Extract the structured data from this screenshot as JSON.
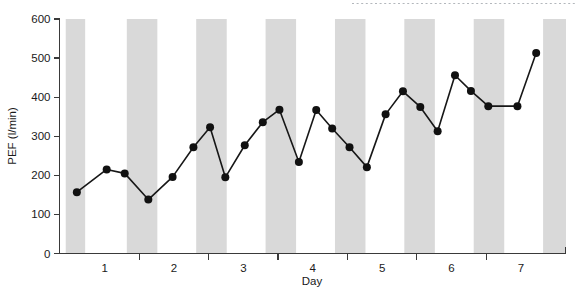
{
  "chart_data": {
    "type": "line",
    "title": "",
    "xlabel": "Day",
    "ylabel": "PEF (l/min)",
    "xlim": [
      0.35,
      7.65
    ],
    "ylim": [
      0,
      600
    ],
    "grid": false,
    "legend": "none",
    "y_ticks": [
      0,
      100,
      200,
      300,
      400,
      500,
      600
    ],
    "y_tick_labels": [
      "0",
      "100",
      "200",
      "300",
      "400",
      "500",
      "600"
    ],
    "x_ticks": [
      1.5,
      2.5,
      3.5,
      4.5,
      5.5,
      6.5
    ],
    "x_tick_labels": [
      "1",
      "2",
      "3",
      "4",
      "5",
      "6",
      "7"
    ],
    "x_label_positions": [
      1,
      2,
      3,
      4,
      5,
      6,
      7
    ],
    "marker": "filled-circle",
    "marker_size": 4,
    "line_color": "#171717",
    "marker_color": "#111111",
    "band_color": "#d9d9d9",
    "background_color": "#ffffff",
    "axis_color": "#3a3a3a",
    "night_bands_label": "night (shaded)",
    "night_bands": [
      {
        "start": 0.44,
        "end": 0.72
      },
      {
        "start": 1.32,
        "end": 1.76
      },
      {
        "start": 2.32,
        "end": 2.76
      },
      {
        "start": 3.32,
        "end": 3.76
      },
      {
        "start": 4.32,
        "end": 4.76
      },
      {
        "start": 5.32,
        "end": 5.76
      },
      {
        "start": 6.32,
        "end": 6.76
      },
      {
        "start": 7.32,
        "end": 7.65
      }
    ],
    "x": [
      0.6,
      1.03,
      1.29,
      1.63,
      1.98,
      2.28,
      2.52,
      2.74,
      3.02,
      3.28,
      3.52,
      3.78,
      4.03,
      4.26,
      4.51,
      4.76,
      5.03,
      5.28,
      5.53,
      5.78,
      6.02,
      6.52,
      6.78,
      7.28
    ],
    "values": [
      157,
      215,
      205,
      138,
      196,
      272,
      323,
      195,
      277,
      336,
      368,
      234,
      367,
      320,
      272,
      221,
      356,
      415,
      375,
      313,
      456,
      416,
      377,
      377
    ],
    "points": [
      {
        "day": 0.6,
        "pef": 157
      },
      {
        "day": 1.03,
        "pef": 215
      },
      {
        "day": 1.29,
        "pef": 205
      },
      {
        "day": 1.63,
        "pef": 138
      },
      {
        "day": 1.98,
        "pef": 196
      },
      {
        "day": 2.28,
        "pef": 272
      },
      {
        "day": 2.52,
        "pef": 323
      },
      {
        "day": 2.74,
        "pef": 195
      },
      {
        "day": 3.02,
        "pef": 277
      },
      {
        "day": 3.28,
        "pef": 336
      },
      {
        "day": 3.52,
        "pef": 368
      },
      {
        "day": 3.8,
        "pef": 234
      },
      {
        "day": 4.05,
        "pef": 367
      },
      {
        "day": 4.28,
        "pef": 320
      },
      {
        "day": 4.53,
        "pef": 272
      },
      {
        "day": 4.78,
        "pef": 221
      },
      {
        "day": 5.05,
        "pef": 356
      },
      {
        "day": 5.3,
        "pef": 415
      },
      {
        "day": 5.55,
        "pef": 375
      },
      {
        "day": 5.8,
        "pef": 313
      },
      {
        "day": 6.05,
        "pef": 456
      },
      {
        "day": 6.28,
        "pef": 416
      },
      {
        "day": 6.53,
        "pef": 377
      },
      {
        "day": 6.95,
        "pef": 377
      },
      {
        "day": 7.22,
        "pef": 513
      }
    ]
  }
}
